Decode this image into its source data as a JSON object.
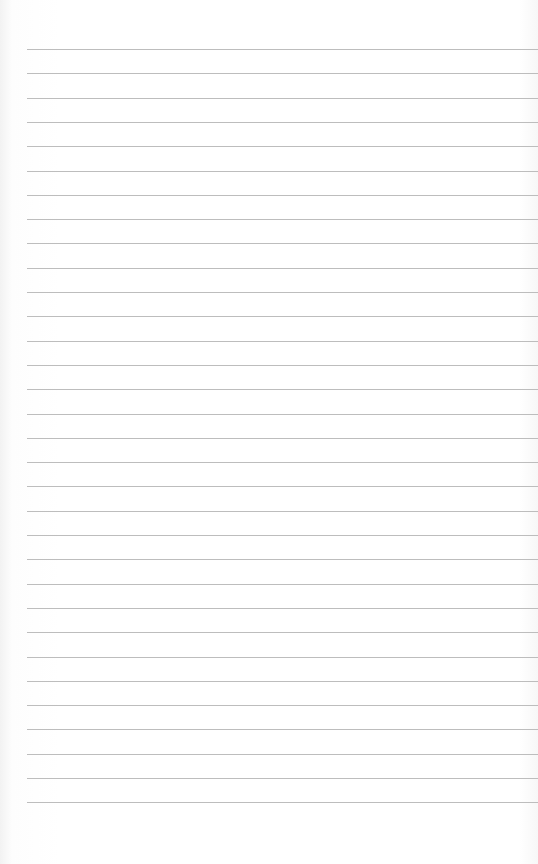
{
  "page": {
    "type": "lined-paper",
    "background": "#ffffff",
    "line_color": "#bdbdbd",
    "line_count": 32,
    "first_line_y": 49,
    "line_spacing": 24.3,
    "line_left": 27
  }
}
